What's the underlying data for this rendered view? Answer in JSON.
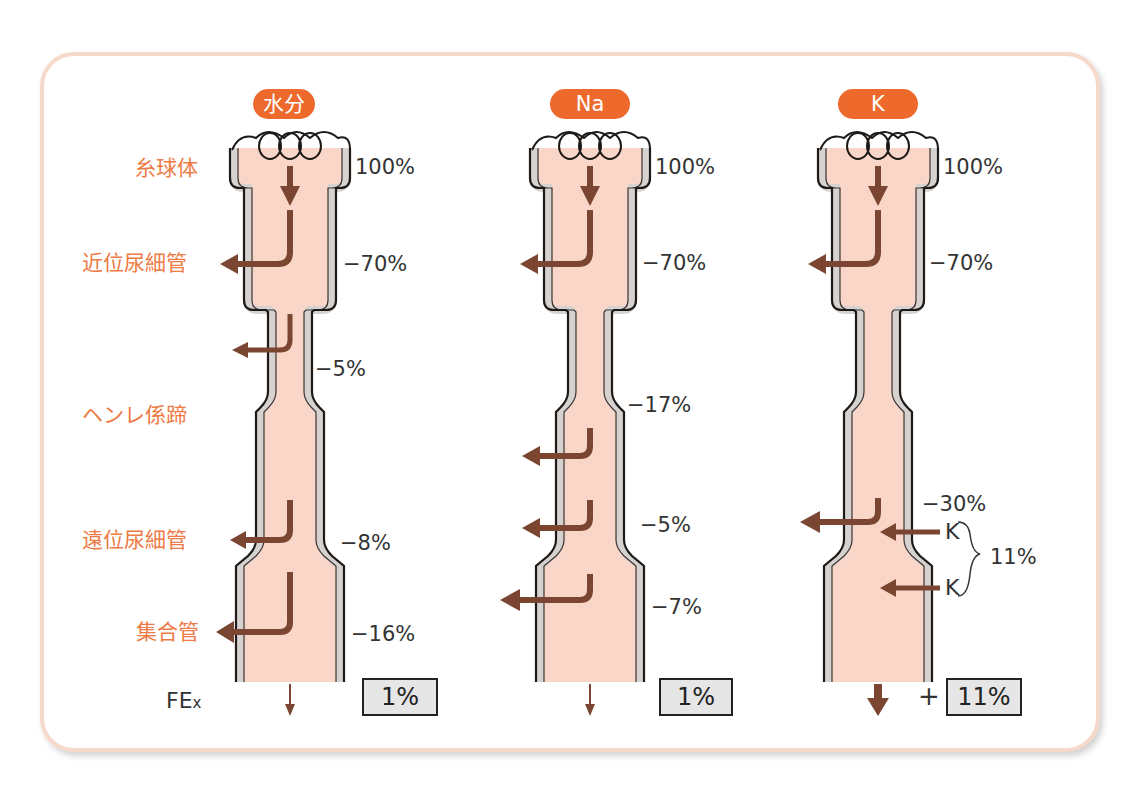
{
  "segments": {
    "glomerulus": "糸球体",
    "proximal_tubule": "近位尿細管",
    "loop_of_henle": "ヘンレ係蹄",
    "distal_tubule": "遠位尿細管",
    "collecting_duct": "集合管"
  },
  "fex_label": {
    "main": "FE",
    "sub": "x"
  },
  "columns": [
    {
      "title": "水分",
      "filtered": "100%",
      "proximal": "−70%",
      "loop": "−5%",
      "distal": "−8%",
      "collecting": "−16%",
      "fe": "1%"
    },
    {
      "title": "Na",
      "filtered": "100%",
      "proximal": "−70%",
      "loop": "−17%",
      "distal": "−5%",
      "collecting": "−7%",
      "fe": "1%"
    },
    {
      "title": "K",
      "filtered": "100%",
      "proximal": "−70%",
      "loop_distal": "−30%",
      "secretion_label_1": "K",
      "secretion_label_2": "K",
      "secretion_total": "11%",
      "plus": "+",
      "fe": "11%"
    }
  ],
  "colors": {
    "accent_orange": "#ee6a2c",
    "label_orange": "#ee7a45",
    "tubule_fill": "#f9d6c8",
    "tubule_wall": "#d6d2d0",
    "arrow_brown": "#7a4632",
    "frame_border": "#f7d9cc",
    "result_box_fill": "#e6e6e6"
  }
}
